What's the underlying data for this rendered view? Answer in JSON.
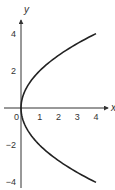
{
  "chart_data": {
    "type": "line",
    "title": "",
    "xlabel": "x",
    "ylabel": "y",
    "xlim": [
      -1.1,
      4.9
    ],
    "ylim": [
      -4.1,
      5.0
    ],
    "grid": false,
    "legend": null,
    "x_ticks": [
      0,
      1,
      2,
      3,
      4
    ],
    "y_ticks": [
      4,
      2,
      -2,
      -4
    ],
    "x_tick_labels": [
      "0",
      "1",
      "2",
      "3",
      "4"
    ],
    "y_tick_labels": [
      "4",
      "2",
      "−2",
      "−4"
    ],
    "series": [
      {
        "name": "x = y^2/4",
        "color": "#222222",
        "points": [
          {
            "x": 4.0,
            "y": -4.0
          },
          {
            "x": 2.25,
            "y": -3.0
          },
          {
            "x": 1.0,
            "y": -2.0
          },
          {
            "x": 0.25,
            "y": -1.0
          },
          {
            "x": 0.0,
            "y": 0.0
          },
          {
            "x": 0.25,
            "y": 1.0
          },
          {
            "x": 1.0,
            "y": 2.0
          },
          {
            "x": 2.25,
            "y": 3.0
          },
          {
            "x": 4.0,
            "y": 4.0
          }
        ]
      }
    ]
  },
  "layout": {
    "origin_px": [
      21,
      108
    ],
    "px_per_unit_x": 18.75,
    "px_per_unit_y": 18.6,
    "axis_color": "#333333"
  }
}
